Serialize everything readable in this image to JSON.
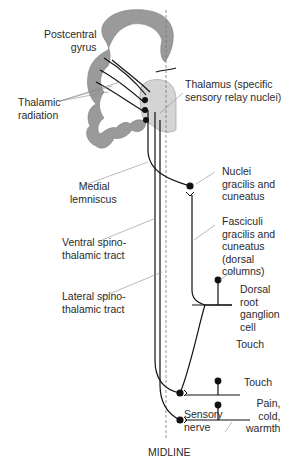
{
  "diagram": {
    "colors": {
      "cortex": "#9a9a9a",
      "thalamus": "#d4d4d4",
      "line": "#111111",
      "midline": "#777777",
      "leader": "#8a8a8a"
    },
    "labels": {
      "postcentral_gyrus": "Postcentral\n     gyrus",
      "thalamic_radiation": "Thalamic\nradiation",
      "thalamus": "Thalamus (specific\nsensory relay nuclei)",
      "medial_lemniscus": "   Medial\nlemniscus",
      "nuclei_gracilis": "Nuclei\ngracilis and\ncuneatus",
      "fasciculi": "Fasciculi\ngracilis and\ncuneatus\n(dorsal\ncolumns)",
      "ventral_spinothalamic": "Ventral spino-\nthalamic tract",
      "lateral_spinothalamic": "Lateral spino-\nthalamic tract",
      "dorsal_root": "Dorsal\nroot\nganglion\ncell",
      "touch_1": "Touch",
      "touch_2": "Touch",
      "pain": "Pain,\ncold,\nwarmth",
      "sensory_nerve": "Sensory\nnerve",
      "midline": "MIDLINE"
    }
  }
}
